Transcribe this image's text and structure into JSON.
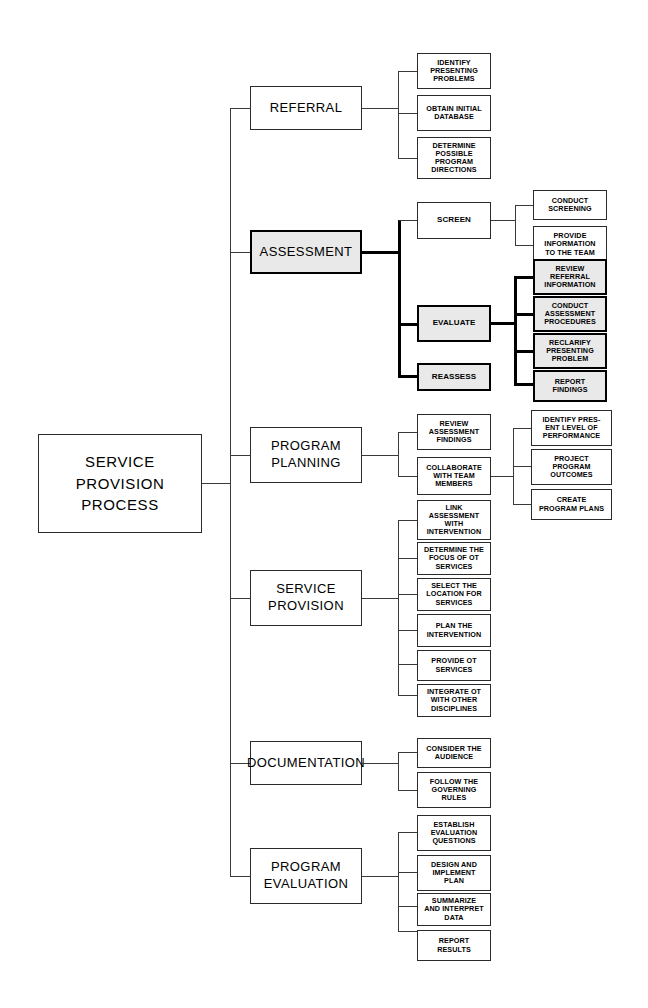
{
  "diagram": {
    "root": {
      "label": "SERVICE\nPROVISION\nPROCESS"
    },
    "branches": [
      {
        "label": "REFERRAL",
        "emphasis": false,
        "children": [
          {
            "label": "IDENTIFY\nPRESENTING\nPROBLEMS",
            "emphasis": false,
            "children": []
          },
          {
            "label": "OBTAIN INITIAL\nDATABASE",
            "emphasis": false,
            "children": []
          },
          {
            "label": "DETERMINE\nPOSSIBLE\nPROGRAM\nDIRECTIONS",
            "emphasis": false,
            "children": []
          }
        ]
      },
      {
        "label": "ASSESSMENT",
        "emphasis": true,
        "children": [
          {
            "label": "SCREEN",
            "emphasis": false,
            "children": [
              {
                "label": "CONDUCT\nSCREENING",
                "emphasis": false
              },
              {
                "label": "PROVIDE\nINFORMATION\nTO THE TEAM",
                "emphasis": false
              }
            ]
          },
          {
            "label": "EVALUATE",
            "emphasis": true,
            "children": [
              {
                "label": "REVIEW\nREFERRAL\nINFORMATION",
                "emphasis": true
              },
              {
                "label": "CONDUCT\nASSESSMENT\nPROCEDURES",
                "emphasis": true
              },
              {
                "label": "RECLARIFY\nPRESENTING\nPROBLEM",
                "emphasis": true
              },
              {
                "label": "REPORT\nFINDINGS",
                "emphasis": true
              }
            ]
          },
          {
            "label": "REASSESS",
            "emphasis": true,
            "children": []
          }
        ]
      },
      {
        "label": "PROGRAM\nPLANNING",
        "emphasis": false,
        "children": [
          {
            "label": "REVIEW\nASSESSMENT\nFINDINGS",
            "emphasis": false,
            "children": []
          },
          {
            "label": "COLLABORATE\nWITH TEAM\nMEMBERS",
            "emphasis": false,
            "children": [
              {
                "label": "IDENTIFY  PRES-\nENT LEVEL OF\nPERFORMANCE",
                "emphasis": false
              },
              {
                "label": "PROJECT\nPROGRAM\nOUTCOMES",
                "emphasis": false
              },
              {
                "label": "CREATE\nPROGRAM PLANS",
                "emphasis": false
              }
            ]
          }
        ]
      },
      {
        "label": "SERVICE\nPROVISION",
        "emphasis": false,
        "children": [
          {
            "label": "LINK\nASSESSMENT\nWITH\nINTERVENTION",
            "emphasis": false,
            "children": []
          },
          {
            "label": "DETERMINE THE\nFOCUS OF OT\nSERVICES",
            "emphasis": false,
            "children": []
          },
          {
            "label": "SELECT THE\nLOCATION FOR\nSERVICES",
            "emphasis": false,
            "children": []
          },
          {
            "label": "PLAN THE\nINTERVENTION",
            "emphasis": false,
            "children": []
          },
          {
            "label": "PROVIDE OT\nSERVICES",
            "emphasis": false,
            "children": []
          },
          {
            "label": "INTEGRATE OT\nWITH OTHER\nDISCIPLINES",
            "emphasis": false,
            "children": []
          }
        ]
      },
      {
        "label": "DOCUMENTATION",
        "emphasis": false,
        "children": [
          {
            "label": "CONSIDER THE\nAUDIENCE",
            "emphasis": false,
            "children": []
          },
          {
            "label": "FOLLOW THE\nGOVERNING\nRULES",
            "emphasis": false,
            "children": []
          }
        ]
      },
      {
        "label": "PROGRAM\nEVALUATION",
        "emphasis": false,
        "children": [
          {
            "label": "ESTABLISH\nEVALUATION\nQUESTIONS",
            "emphasis": false,
            "children": []
          },
          {
            "label": "DESIGN AND\nIMPLEMENT\nPLAN",
            "emphasis": false,
            "children": []
          },
          {
            "label": "SUMMARIZE\nAND INTERPRET\nDATA",
            "emphasis": false,
            "children": []
          },
          {
            "label": "REPORT\nRESULTS",
            "emphasis": false,
            "children": []
          }
        ]
      }
    ],
    "colors": {
      "line": "#3a3a3a",
      "emphasis_border": "#000000",
      "emphasis_fill": "#e9e9e9",
      "box_border": "#2a2a2a",
      "background": "#ffffff",
      "text": "#000000"
    }
  }
}
